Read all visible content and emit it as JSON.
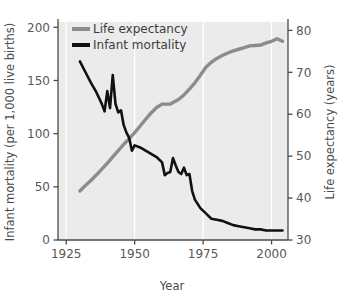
{
  "chart_data": {
    "type": "line",
    "title": "",
    "xlabel": "Year",
    "ylabel": "Infant mortality (per 1,000 live births)",
    "y2label": "Life expectancy (years)",
    "xlim": [
      1922,
      2006
    ],
    "ylim": [
      0,
      205
    ],
    "y2lim": [
      30,
      82
    ],
    "xticks": [
      1925,
      1950,
      1975,
      2000
    ],
    "xtick_labels": [
      "1925",
      "1950",
      "1975",
      "2000"
    ],
    "yticks": [
      0,
      50,
      100,
      150,
      200
    ],
    "ytick_labels": [
      "0",
      "50",
      "100",
      "150",
      "200"
    ],
    "y2ticks": [
      30,
      40,
      50,
      60,
      70,
      80
    ],
    "y2tick_labels": [
      "30",
      "40",
      "50",
      "60",
      "70",
      "80"
    ],
    "grid": "vertical-white",
    "legend_position": "top-left",
    "plot_background": "#ebebeb",
    "series": [
      {
        "name": "Life expectancy",
        "axis": "right",
        "color": "#8c8c8c",
        "x": [
          1930,
          1932,
          1934,
          1936,
          1938,
          1940,
          1942,
          1944,
          1946,
          1948,
          1950,
          1952,
          1954,
          1956,
          1958,
          1960,
          1961,
          1962,
          1963,
          1964,
          1966,
          1968,
          1970,
          1972,
          1974,
          1976,
          1978,
          1980,
          1982,
          1984,
          1986,
          1988,
          1990,
          1992,
          1994,
          1996,
          1998,
          2000,
          2002,
          2004
        ],
        "values": [
          41.7,
          43.0,
          44.2,
          45.5,
          46.9,
          48.3,
          49.8,
          51.3,
          52.8,
          54.2,
          55.6,
          57.2,
          58.8,
          60.3,
          61.6,
          62.4,
          62.4,
          62.4,
          62.4,
          62.8,
          63.5,
          64.6,
          66.0,
          67.5,
          69.3,
          71.2,
          72.4,
          73.3,
          74.0,
          74.6,
          75.1,
          75.5,
          75.9,
          76.3,
          76.4,
          76.5,
          77.0,
          77.4,
          78.0,
          77.4
        ]
      },
      {
        "name": "Infant mortality",
        "axis": "left",
        "color": "#111111",
        "x": [
          1930,
          1932,
          1934,
          1936,
          1938,
          1939,
          1940,
          1941,
          1942,
          1943,
          1944,
          1945,
          1946,
          1947,
          1948,
          1949,
          1950,
          1952,
          1954,
          1956,
          1958,
          1960,
          1961,
          1962,
          1963,
          1964,
          1965,
          1966,
          1967,
          1968,
          1969,
          1970,
          1971,
          1972,
          1974,
          1976,
          1978,
          1980,
          1982,
          1984,
          1986,
          1988,
          1990,
          1992,
          1994,
          1996,
          1998,
          2000,
          2002,
          2004
        ],
        "values": [
          168,
          158,
          148,
          139,
          128,
          121,
          140,
          124,
          155,
          128,
          120,
          122,
          108,
          101,
          96,
          84,
          89,
          87,
          84,
          81,
          78,
          73,
          61,
          63,
          64,
          77,
          70,
          64,
          62,
          68,
          61,
          62,
          46,
          38,
          30,
          25,
          20,
          19,
          18,
          16,
          14,
          13,
          12,
          11,
          10,
          10,
          9,
          9,
          9,
          9
        ]
      }
    ]
  },
  "legend": {
    "items": [
      {
        "label": "Life expectancy",
        "color": "#8c8c8c"
      },
      {
        "label": "Infant mortality",
        "color": "#111111"
      }
    ]
  }
}
